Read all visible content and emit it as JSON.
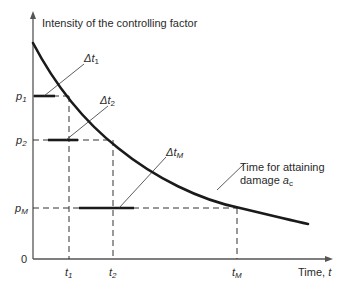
{
  "diagram": {
    "y_axis_label": "Intensity of the controlling factor",
    "x_axis_label": "Time, ",
    "x_axis_var": "t",
    "origin_label": "0",
    "y_ticks": [
      {
        "base": "p",
        "sub": "1"
      },
      {
        "base": "p",
        "sub": "2"
      },
      {
        "base": "p",
        "sub": "M"
      }
    ],
    "x_ticks": [
      {
        "base": "t",
        "sub": "1"
      },
      {
        "base": "t",
        "sub": "2"
      },
      {
        "base": "t",
        "sub": "M"
      }
    ],
    "intervals": [
      {
        "base": "Δt",
        "sub": "1"
      },
      {
        "base": "Δt",
        "sub": "2"
      },
      {
        "base": "Δt",
        "sub": "M"
      }
    ],
    "curve_annotation": {
      "line1": "Time for attaining",
      "line2_prefix": "damage ",
      "line2_var": "a",
      "line2_sub": "c"
    },
    "colors": {
      "axis": "#555555",
      "curve": "#1a1a1a",
      "dashed": "#333333",
      "text": "#2a2a2a"
    }
  }
}
